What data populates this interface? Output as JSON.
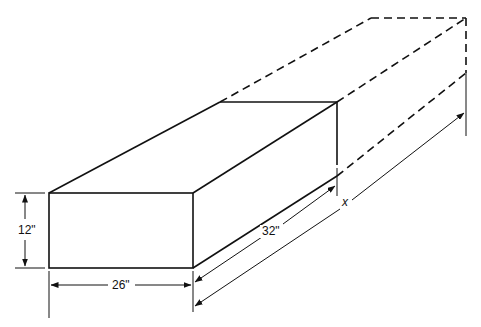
{
  "diagram": {
    "type": "isometric-box-dimension-drawing",
    "dimensions": {
      "height": "12\"",
      "width": "26\"",
      "length_shown": "32\"",
      "unknown_length": "x"
    },
    "colors": {
      "line": "#111111",
      "background": "#ffffff"
    },
    "elements": {
      "solid_box": "rectangular block 26\" wide, 12\" high, 32\" long",
      "dashed_extension": "dashed continuation of the block to total length x"
    }
  }
}
